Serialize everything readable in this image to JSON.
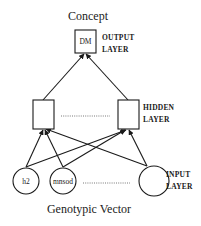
{
  "diagram": {
    "title_top": "Concept",
    "title_bottom": "Genotypic Vector",
    "output_layer": {
      "label_line1": "OUTPUT",
      "label_line2": "LAYER",
      "nodes": [
        {
          "id": "out",
          "label": "DM",
          "shape": "square"
        }
      ]
    },
    "hidden_layer": {
      "label_line1": "HIDDEN",
      "label_line2": "LAYER",
      "nodes": [
        {
          "id": "h_left",
          "label": "",
          "shape": "square"
        },
        {
          "id": "h_right",
          "label": "",
          "shape": "square"
        }
      ],
      "ellipsis": "dotted-line"
    },
    "input_layer": {
      "label_line1": "INPUT",
      "label_line2": "LAYER",
      "nodes": [
        {
          "id": "in1",
          "label": "h2",
          "shape": "circle"
        },
        {
          "id": "in2",
          "label": "mnsod",
          "shape": "circle"
        },
        {
          "id": "in3",
          "label": "",
          "shape": "circle"
        }
      ],
      "ellipsis": "dotted-line"
    },
    "edges": [
      {
        "from": "h_left",
        "to": "out"
      },
      {
        "from": "h_right",
        "to": "out"
      },
      {
        "from": "in1",
        "to": "h_left"
      },
      {
        "from": "in1",
        "to": "h_right"
      },
      {
        "from": "in2",
        "to": "h_left"
      },
      {
        "from": "in2",
        "to": "h_right"
      },
      {
        "from": "in3",
        "to": "h_left"
      },
      {
        "from": "in3",
        "to": "h_right"
      }
    ],
    "colors": {
      "stroke": "#1a1a1a",
      "background": "#ffffff"
    }
  }
}
